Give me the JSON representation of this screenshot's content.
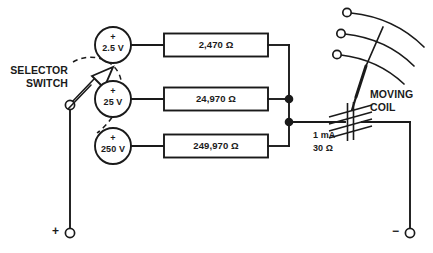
{
  "diagram": {
    "ink_color": "#1a1a1a",
    "background": "#ffffff"
  },
  "selector_switch": {
    "label_line1": "SELECTOR",
    "label_line2": "SWITCH",
    "pointer_icon": "arrow-pointer-icon",
    "pivot_icon": "pivot-terminal-icon",
    "arc_icon": "dashed-arc-icon"
  },
  "ranges": [
    {
      "source_plus": "+",
      "source_label": "2.5 V",
      "resistor_label": "2,470 Ω",
      "source_icon": "voltage-range-circle-icon"
    },
    {
      "source_plus": "+",
      "source_label": "25 V",
      "resistor_label": "24,970 Ω",
      "source_icon": "voltage-range-circle-icon"
    },
    {
      "source_plus": "+",
      "source_label": "250 V",
      "resistor_label": "249,970 Ω",
      "source_icon": "voltage-range-circle-icon"
    }
  ],
  "meter": {
    "current_rating": "1 mA",
    "resistance_rating": "30 Ω",
    "coil_label_line1": "MOVING",
    "coil_label_line2": "COIL",
    "coil_icon": "moving-coil-icon",
    "needle_icon": "meter-needle-icon",
    "scale_arc_count": 3,
    "scale_terminal_count": 3
  },
  "terminals": {
    "positive_symbol": "+",
    "negative_symbol": "−",
    "positive_icon": "positive-terminal-icon",
    "negative_icon": "negative-terminal-icon"
  },
  "junctions": {
    "count": 2,
    "icon": "junction-dot-icon"
  }
}
